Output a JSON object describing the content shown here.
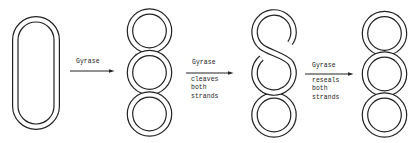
{
  "figure": {
    "panels": [
      {
        "name": "relaxed-circular-dna",
        "shape": "oval-double-strand"
      },
      {
        "name": "supercoiled-dna-three-loops",
        "shape": "figure-eight-chain"
      },
      {
        "name": "cleaved-dna-intermediate",
        "shape": "figure-eight-chain-with-gap"
      },
      {
        "name": "resealed-supercoiled-dna",
        "shape": "figure-eight-chain"
      }
    ],
    "steps": [
      {
        "label_above": "Gyrase",
        "label_below": []
      },
      {
        "label_above": "Gyrase",
        "label_below": [
          "cleaves",
          "both",
          "strands"
        ]
      },
      {
        "label_above": "Gyrase",
        "label_below": [
          "reseals",
          "both",
          "strands"
        ]
      }
    ],
    "icons": {
      "arrow": "arrow-right"
    }
  },
  "colors": {
    "stroke": "#222222",
    "background": "#ffffff"
  }
}
